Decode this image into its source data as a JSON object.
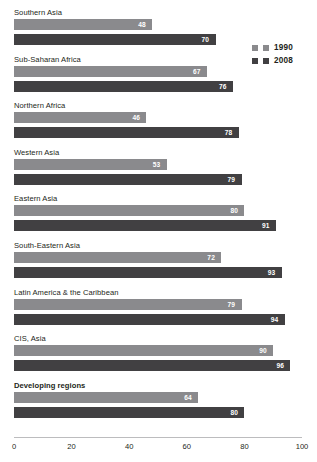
{
  "title_remnant": "",
  "legend": {
    "position": "right",
    "entries": [
      {
        "label": "1990",
        "color": "#8a8a8d"
      },
      {
        "label": "2008",
        "color": "#414042"
      }
    ]
  },
  "axis": {
    "ticks": [
      "0",
      "20",
      "40",
      "60",
      "80",
      "100"
    ],
    "min": 0,
    "max": 100
  },
  "chart_data": {
    "type": "bar",
    "orientation": "horizontal",
    "title": "",
    "subtitle": "",
    "xlabel": "",
    "ylabel": "",
    "xlim": [
      0,
      100
    ],
    "grid": false,
    "legend_position": "right",
    "categories": [
      "Southern Asia",
      "Sub-Saharan Africa",
      "Northern Africa",
      "Western Asia",
      "Eastern Asia",
      "South-Eastern Asia",
      "Latin America & the Caribbean",
      "CIS, Asia",
      "Developing regions"
    ],
    "emphasized_categories": [
      "Developing regions"
    ],
    "series": [
      {
        "name": "1990",
        "color": "#8a8a8d",
        "values": [
          48,
          67,
          46,
          53,
          80,
          72,
          79,
          90,
          64
        ]
      },
      {
        "name": "2008",
        "color": "#414042",
        "values": [
          70,
          76,
          78,
          79,
          91,
          93,
          94,
          96,
          80
        ]
      }
    ],
    "tick_labels": [
      "0",
      "20",
      "40",
      "60",
      "80",
      "100"
    ]
  }
}
